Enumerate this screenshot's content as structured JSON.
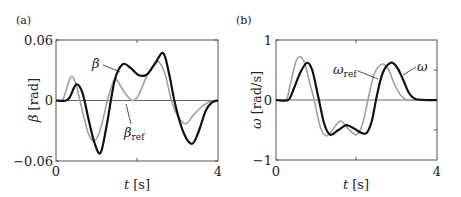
{
  "chart_data": [
    {
      "type": "line",
      "panel_label": "(a)",
      "title": "",
      "xlabel": "t [s]",
      "xlabel_var": "t",
      "xlabel_unit": "[s]",
      "ylabel": "β [rad]",
      "ylabel_var": "β",
      "ylabel_unit": "[rad]",
      "xlim": [
        0,
        4
      ],
      "ylim": [
        -0.06,
        0.06
      ],
      "xticks": [
        "0",
        "4"
      ],
      "yticks": [
        "0.06",
        "0",
        "-0.06"
      ],
      "grid": false,
      "zero_line": true,
      "annotations": [
        {
          "text": "β",
          "target": "β"
        },
        {
          "text": "β_ref",
          "target": "β_ref"
        }
      ],
      "series": [
        {
          "name": "β_ref",
          "color": "#a0a0a0",
          "x": [
            0,
            0.15,
            0.25,
            0.38,
            0.5,
            0.65,
            0.8,
            0.95,
            1.1,
            1.3,
            1.45,
            1.6,
            1.75,
            1.9,
            2.05,
            2.25,
            2.45,
            2.55,
            2.7,
            2.85,
            3.0,
            3.2,
            3.4,
            3.6,
            3.8,
            4.0
          ],
          "values": [
            0,
            0,
            0.01,
            0.024,
            0.015,
            -0.01,
            -0.033,
            -0.04,
            -0.028,
            0.005,
            0.021,
            0.014,
            0.005,
            0.0,
            0.006,
            0.025,
            0.036,
            0.038,
            0.025,
            0.0,
            -0.015,
            -0.023,
            -0.014,
            -0.006,
            -0.001,
            0
          ]
        },
        {
          "name": "β",
          "color": "#111111",
          "x": [
            0,
            0.25,
            0.35,
            0.5,
            0.65,
            0.8,
            0.95,
            1.1,
            1.25,
            1.45,
            1.65,
            1.85,
            2.05,
            2.25,
            2.45,
            2.65,
            2.8,
            2.95,
            3.15,
            3.35,
            3.5,
            3.7,
            3.85,
            4.0
          ],
          "values": [
            0,
            0,
            0.004,
            0.016,
            0.008,
            -0.018,
            -0.042,
            -0.052,
            -0.025,
            0.02,
            0.036,
            0.032,
            0.025,
            0.026,
            0.037,
            0.047,
            0.025,
            -0.005,
            -0.032,
            -0.043,
            -0.033,
            -0.01,
            -0.002,
            0
          ]
        }
      ]
    },
    {
      "type": "line",
      "panel_label": "(b)",
      "title": "",
      "xlabel": "t [s]",
      "xlabel_var": "t",
      "xlabel_unit": "[s]",
      "ylabel": "ω [rad/s]",
      "ylabel_var": "ω",
      "ylabel_unit": "[rad/s]",
      "xlim": [
        0,
        4
      ],
      "ylim": [
        -1,
        1
      ],
      "xticks": [
        "0",
        "4"
      ],
      "yticks": [
        "1",
        "0",
        "-1"
      ],
      "grid": false,
      "zero_line": true,
      "annotations": [
        {
          "text": "ω_ref",
          "target": "ω_ref"
        },
        {
          "text": "ω",
          "target": "ω"
        }
      ],
      "series": [
        {
          "name": "ω_ref",
          "color": "#a0a0a0",
          "x": [
            0,
            0.25,
            0.35,
            0.5,
            0.6,
            0.72,
            0.85,
            0.95,
            1.1,
            1.25,
            1.4,
            1.6,
            1.8,
            2.0,
            2.15,
            2.3,
            2.45,
            2.65,
            2.8,
            2.95,
            3.1,
            3.25,
            3.5,
            4.0
          ],
          "values": [
            0,
            0,
            0.25,
            0.65,
            0.72,
            0.6,
            0.25,
            0.0,
            -0.45,
            -0.6,
            -0.5,
            -0.35,
            -0.48,
            -0.58,
            -0.4,
            0.05,
            0.45,
            0.6,
            0.5,
            0.25,
            0.08,
            0.0,
            0,
            0
          ]
        },
        {
          "name": "ω",
          "color": "#111111",
          "x": [
            0,
            0.3,
            0.42,
            0.6,
            0.77,
            0.9,
            1.05,
            1.2,
            1.35,
            1.55,
            1.75,
            1.95,
            2.1,
            2.25,
            2.38,
            2.5,
            2.65,
            2.85,
            3.0,
            3.15,
            3.3,
            3.45,
            3.7,
            4.0
          ],
          "values": [
            0,
            0,
            0.15,
            0.45,
            0.62,
            0.5,
            0.05,
            -0.4,
            -0.58,
            -0.5,
            -0.42,
            -0.48,
            -0.54,
            -0.55,
            -0.35,
            0.05,
            0.45,
            0.62,
            0.55,
            0.35,
            0.12,
            0.02,
            0,
            0
          ]
        }
      ]
    }
  ]
}
